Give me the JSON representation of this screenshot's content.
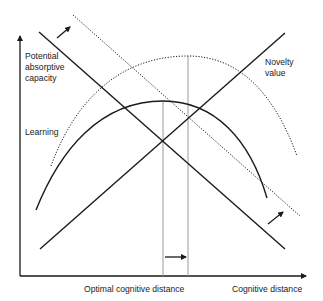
{
  "diagram": {
    "y_axis_labels": {
      "absorptive_line1": "Potential",
      "absorptive_line2": "absorptive",
      "absorptive_line3": "capacity",
      "learning": "Learning"
    },
    "curve_labels": {
      "novelty_line1": "Novelty",
      "novelty_line2": "value"
    },
    "x_axis_labels": {
      "optimal": "Optimal cognitive distance",
      "axis": "Cognitive distance"
    },
    "colors": {
      "line": "#1a1a1a",
      "guide": "#9a9a9a"
    }
  }
}
